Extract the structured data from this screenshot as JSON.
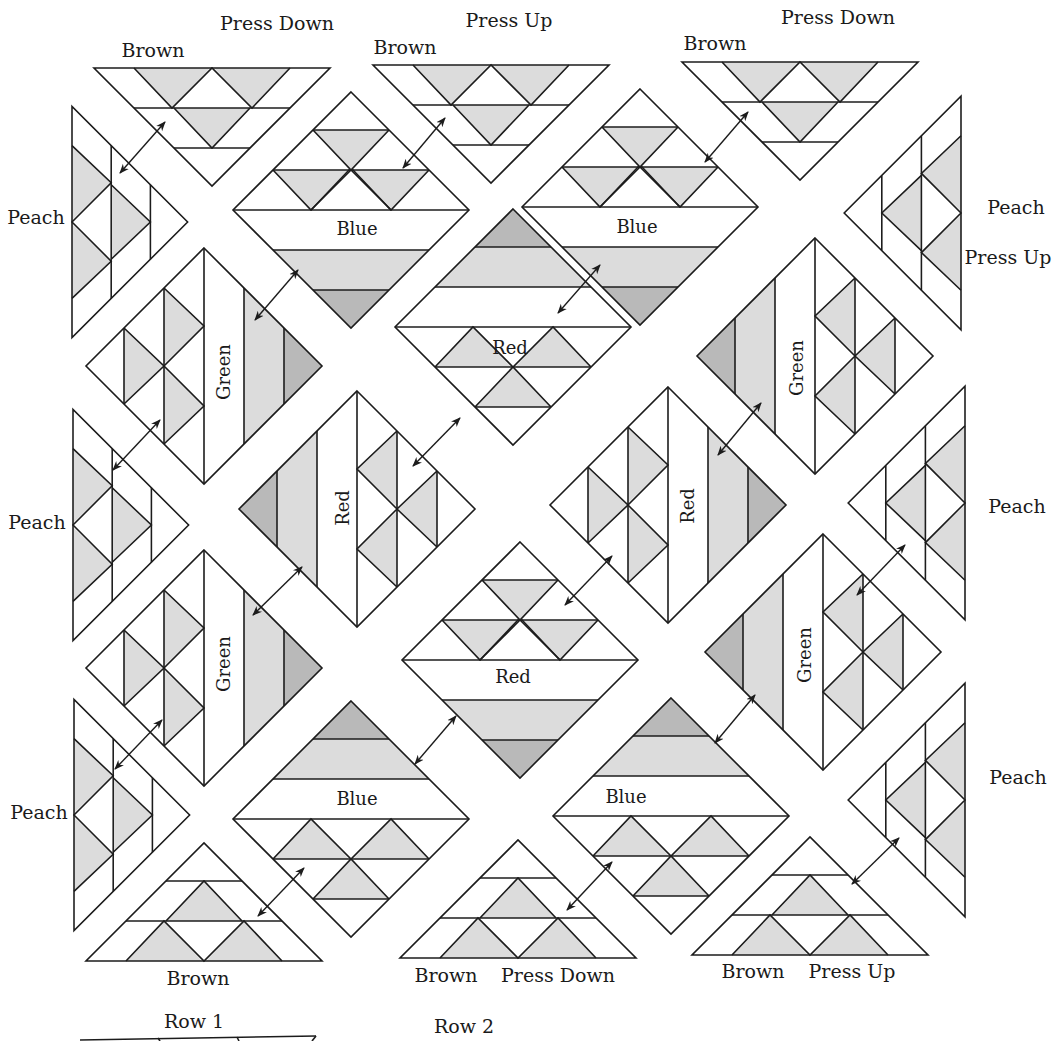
{
  "diagram": {
    "type": "quilt-assembly-diagram",
    "colors": {
      "outline": "#1c1c1c",
      "light_gray": "#dcdcdc",
      "dark_gray": "#b9b9b9",
      "background": "#ffffff"
    },
    "labels": {
      "top_left_brown": "Brown",
      "top_left_press": "Press Down",
      "top_mid_brown": "Brown",
      "top_mid_press": "Press Up",
      "top_right_brown": "Brown",
      "top_right_press": "Press Down",
      "right_top_peach": "Peach",
      "right_top_press": "Press Up",
      "right_mid_peach": "Peach",
      "right_bot_peach": "Peach",
      "left_top_peach": "Peach",
      "left_mid_peach": "Peach",
      "left_bot_peach": "Peach",
      "bottom_left_brown": "Brown",
      "bottom_mid_brown": "Brown",
      "bottom_mid_press": "Press Down",
      "bottom_right_brown": "Brown",
      "bottom_right_press": "Press Up",
      "row1": "Row 1",
      "row2": "Row 2"
    },
    "blocks": {
      "blue_top_left": "Blue",
      "blue_top_right": "Blue",
      "red_center_top": "Red",
      "green_left_top": "Green",
      "green_right_top": "Green",
      "red_left_vertical": "Red",
      "red_right_vertical": "Red",
      "red_center_bottom": "Red",
      "green_left_bottom": "Green",
      "green_right_bottom": "Green",
      "blue_bottom_left": "Blue",
      "blue_bottom_right": "Blue"
    }
  }
}
